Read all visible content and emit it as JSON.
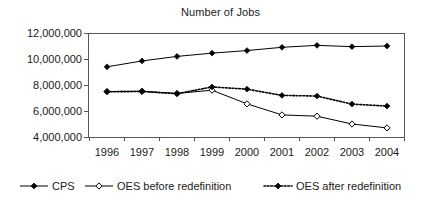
{
  "chart_data": {
    "type": "line",
    "title": "Number of Jobs",
    "xlabel": "",
    "ylabel": "",
    "grid": false,
    "legend_position": "bottom",
    "categories": [
      "1996",
      "1997",
      "1998",
      "1999",
      "2000",
      "2001",
      "2002",
      "2003",
      "2004"
    ],
    "x": [
      1996,
      1997,
      1998,
      1999,
      2000,
      2001,
      2002,
      2003,
      2004
    ],
    "xlim": [
      1995.5,
      2004.5
    ],
    "ylim": [
      4000000,
      12000000
    ],
    "ytick_labels": [
      "12,000,000",
      "10,000,000",
      "8,000,000",
      "6,000,000",
      "4,000,000"
    ],
    "ytick_values": [
      12000000,
      10000000,
      8000000,
      6000000,
      4000000
    ],
    "series": [
      {
        "name": "CPS",
        "marker": "filled-diamond",
        "line": "solid",
        "values": [
          9400000,
          9850000,
          10200000,
          10450000,
          10650000,
          10900000,
          11050000,
          10950000,
          11000000
        ]
      },
      {
        "name": "OES before redefinition",
        "marker": "open-diamond",
        "line": "solid",
        "values": [
          7500000,
          7520000,
          7350000,
          7600000,
          6550000,
          5700000,
          5600000,
          5000000,
          4700000
        ]
      },
      {
        "name": "OES after redefinition",
        "marker": "filled-diamond",
        "line": "dotted",
        "values": [
          7480000,
          7500000,
          7330000,
          7850000,
          7680000,
          7200000,
          7150000,
          6530000,
          6380000
        ]
      }
    ]
  },
  "legend": {
    "items": [
      {
        "label": "CPS"
      },
      {
        "label": "OES before redefinition"
      },
      {
        "label": "OES after redefinition"
      }
    ]
  }
}
